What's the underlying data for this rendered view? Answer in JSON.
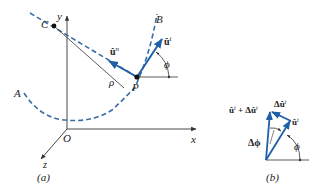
{
  "colors": {
    "curve": "#3a6ea5",
    "vector": "#1f5fa8",
    "axis": "#333333",
    "text": "#222222"
  },
  "panel_a": {
    "caption": "(a)",
    "axes": {
      "x": "x",
      "y": "y",
      "z": "z",
      "origin": "O"
    },
    "curve_endpoints": {
      "start": "A",
      "end": "B"
    },
    "center_label": "C",
    "point_label": "P",
    "radius_label": "ρ",
    "tangent_vector": "û",
    "tangent_sup": "t",
    "normal_vector": "û",
    "normal_sup": "n",
    "angle_label": "ϕ"
  },
  "panel_b": {
    "caption": "(b)",
    "sum_label_a": "û",
    "sum_sup_a": "t",
    "sum_plus": " + Δû",
    "sum_sup_b": "t",
    "delta_label": "Δû",
    "delta_sup": "t",
    "tangent_label": "û",
    "tangent_sup": "t",
    "dphi_label": "Δϕ",
    "phi_label": "ϕ"
  }
}
